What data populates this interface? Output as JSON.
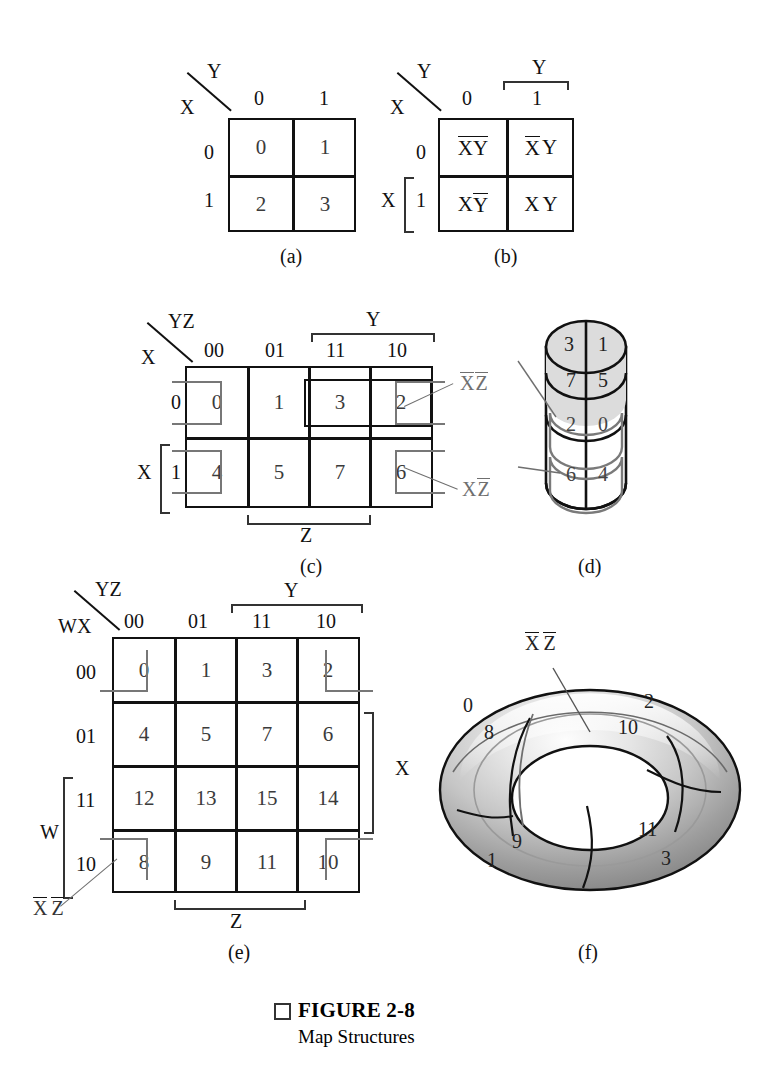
{
  "figure": {
    "caption_marker": "□",
    "caption_title": "FIGURE 2-8",
    "caption_subtitle": "Map Structures"
  },
  "panels": {
    "a": {
      "label": "(a)",
      "corner_top_var": "Y",
      "corner_bottom_var": "X",
      "col_headers": [
        "0",
        "1"
      ],
      "row_headers": [
        "0",
        "1"
      ],
      "cells": [
        [
          "0",
          "1"
        ],
        [
          "2",
          "3"
        ]
      ]
    },
    "b": {
      "label": "(b)",
      "corner_top_var": "Y",
      "corner_bottom_var": "X",
      "col_headers": [
        "0",
        "1"
      ],
      "row_headers": [
        "0",
        "1"
      ],
      "top_bracket_label": "Y",
      "left_bracket_label": "X",
      "cells": [
        [
          {
            "a": "X",
            "a_bar": true,
            "b": "Y",
            "b_bar": true
          },
          {
            "a": "X",
            "a_bar": true,
            "b": "Y",
            "b_bar": false
          }
        ],
        [
          {
            "a": "X",
            "a_bar": false,
            "b": "Y",
            "b_bar": true
          },
          {
            "a": "X",
            "a_bar": false,
            "b": "Y",
            "b_bar": false
          }
        ]
      ]
    },
    "c": {
      "label": "(c)",
      "corner_top_var": "YZ",
      "corner_bottom_var": "X",
      "col_headers": [
        "00",
        "01",
        "11",
        "10"
      ],
      "row_headers": [
        "0",
        "1"
      ],
      "top_bracket_label": "Y",
      "bottom_bracket_label": "Z",
      "left_bracket_label": "X",
      "cells": [
        [
          "0",
          "1",
          "3",
          "2"
        ],
        [
          "4",
          "5",
          "7",
          "6"
        ]
      ],
      "annotations": [
        {
          "text_a": "X",
          "bar_a": true,
          "text_b": "Z",
          "bar_b": true
        },
        {
          "text_a": "X",
          "bar_a": false,
          "text_b": "Z",
          "bar_b": true
        }
      ]
    },
    "d": {
      "label": "(d)",
      "front_cells": [
        "3",
        "1",
        "7",
        "5"
      ],
      "back_cells": [
        "2",
        "0",
        "6",
        "4"
      ],
      "annotations": [
        {
          "text_a": "X",
          "bar_a": true,
          "text_b": "Z",
          "bar_b": true
        },
        {
          "text_a": "X",
          "bar_a": false,
          "text_b": "Z",
          "bar_b": true
        }
      ]
    },
    "e": {
      "label": "(e)",
      "corner_top_var": "YZ",
      "corner_bottom_var": "WX",
      "col_headers": [
        "00",
        "01",
        "11",
        "10"
      ],
      "row_headers": [
        "00",
        "01",
        "11",
        "10"
      ],
      "top_bracket_label": "Y",
      "bottom_bracket_label": "Z",
      "right_bracket_label": "X",
      "left_bracket_label": "W",
      "cells": [
        [
          "0",
          "1",
          "3",
          "2"
        ],
        [
          "4",
          "5",
          "7",
          "6"
        ],
        [
          "12",
          "13",
          "15",
          "14"
        ],
        [
          "8",
          "9",
          "11",
          "10"
        ]
      ],
      "annotation": {
        "text_a": "X",
        "bar_a": true,
        "text_b": "Z",
        "bar_b": true
      }
    },
    "f": {
      "label": "(f)",
      "annotation": {
        "text_a": "X",
        "bar_a": true,
        "text_b": "Z",
        "bar_b": true
      },
      "cell_numbers": [
        "0",
        "8",
        "2",
        "10",
        "9",
        "1",
        "11",
        "3"
      ]
    }
  },
  "colors": {
    "ink": "#111111",
    "cell_text": "#3b3b3b",
    "group_gray": "#777777",
    "torus_light": "#f2f2f2",
    "torus_mid": "#b9b9b9",
    "torus_dark": "#8a8a8a"
  }
}
